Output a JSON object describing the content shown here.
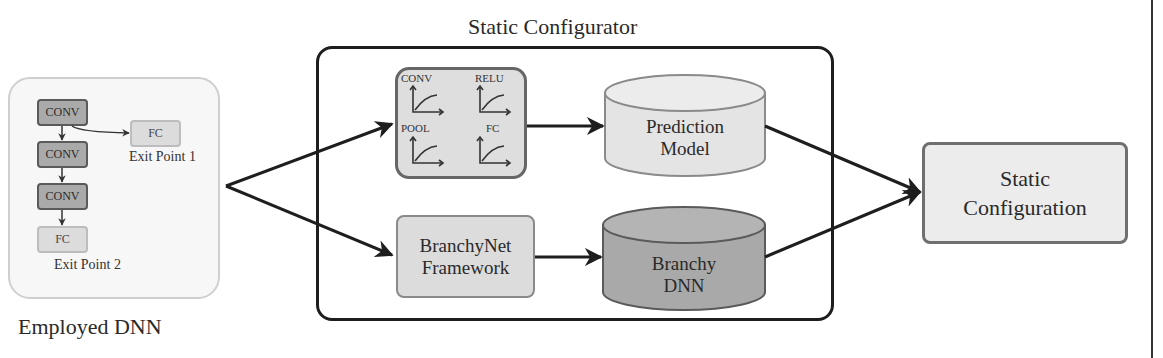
{
  "employed_dnn": {
    "caption": "Employed DNN",
    "layers": [
      {
        "type": "CONV",
        "label": "CONV"
      },
      {
        "type": "CONV",
        "label": "CONV"
      },
      {
        "type": "CONV",
        "label": "CONV"
      },
      {
        "type": "FC",
        "label": "FC"
      }
    ],
    "branch_layer": {
      "label": "FC"
    },
    "exit_points": [
      "Exit Point 1",
      "Exit Point 2"
    ]
  },
  "static_configurator": {
    "title": "Static Configurator",
    "layer_profiles": [
      "CONV",
      "RELU",
      "POOL",
      "FC"
    ],
    "prediction_model": {
      "line1": "Prediction",
      "line2": "Model"
    },
    "branchynet_framework": {
      "line1": "BranchyNet",
      "line2": "Framework"
    },
    "branchy_dnn": {
      "line1": "Branchy",
      "line2": "DNN"
    }
  },
  "output": {
    "line1": "Static",
    "line2": "Configuration"
  },
  "colors": {
    "conv_fill": "#aaaaaa",
    "fc_fill": "#dcdcdc",
    "prediction_model_fill": "#e4e4e4",
    "branchy_dnn_fill": "#a9a9a9",
    "stroke_dark": "#1e1e1e"
  }
}
